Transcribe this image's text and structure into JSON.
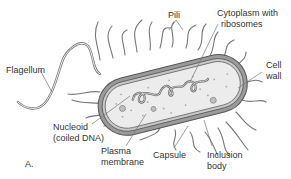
{
  "diagram": {
    "panel_label": "A.",
    "labels": {
      "pili": "Pili",
      "cytoplasm_line1": "Cytoplasm with",
      "cytoplasm_line2": "ribosomes",
      "cell_wall_line1": "Cell",
      "cell_wall_line2": "wall",
      "flagellum": "Flagellum",
      "nucleoid_line1": "Nucleoid",
      "nucleoid_line2": "(coiled DNA)",
      "plasma_line1": "Plasma",
      "plasma_line2": "membrane",
      "capsule": "Capsule",
      "inclusion_line1": "Inclusion",
      "inclusion_line2": "body"
    },
    "colors": {
      "outline": "#555555",
      "capsule_fill": "#9a9a9a",
      "wall_fill": "#c8c8c8",
      "cytoplasm_fill": "#ececec",
      "label_text": "#333333"
    }
  }
}
